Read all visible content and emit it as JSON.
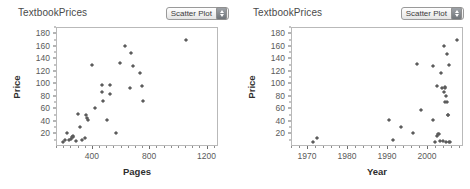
{
  "window": {
    "background": "#ffffff",
    "width": 470,
    "height": 189
  },
  "theme": {
    "point_color": "#5c5c5c",
    "axis_color": "#6b6b6b",
    "frame_color": "#b9b9b9",
    "title_color": "#4a4a4a",
    "label_color": "#5a5a5a"
  },
  "panels": [
    {
      "id": "pages-panel",
      "title": "TextbookPrices",
      "plot_type_menu": {
        "value": "Scatter Plot",
        "stepper_icon": "up-down-stepper-icon"
      }
    },
    {
      "id": "year-panel",
      "title": "TextbookPrices",
      "plot_type_menu": {
        "value": "Scatter Plot",
        "stepper_icon": "up-down-stepper-icon"
      }
    }
  ],
  "chart_data": [
    {
      "type": "scatter",
      "title": "TextbookPrices",
      "xlabel": "Pages",
      "ylabel": "Price",
      "xlim": [
        150,
        1280
      ],
      "ylim": [
        0,
        190
      ],
      "xticks": [
        400,
        800,
        1200
      ],
      "xtick_labels": [
        "400",
        "800",
        "1200"
      ],
      "xtick_minor_step": 50,
      "yticks": [
        20,
        40,
        60,
        80,
        100,
        120,
        140,
        160,
        180
      ],
      "ytick_labels": [
        "20",
        "40",
        "60",
        "80",
        "100",
        "120",
        "140",
        "160",
        "180"
      ],
      "grid": false,
      "legend": "none",
      "marker": "diamond",
      "points": [
        [
          200,
          6
        ],
        [
          210,
          9
        ],
        [
          224,
          20
        ],
        [
          240,
          10
        ],
        [
          252,
          11
        ],
        [
          262,
          14
        ],
        [
          268,
          16
        ],
        [
          272,
          15
        ],
        [
          290,
          8
        ],
        [
          300,
          51
        ],
        [
          318,
          31
        ],
        [
          330,
          9
        ],
        [
          352,
          13
        ],
        [
          360,
          49
        ],
        [
          366,
          45
        ],
        [
          374,
          41
        ],
        [
          402,
          130
        ],
        [
          424,
          60
        ],
        [
          470,
          86
        ],
        [
          474,
          97
        ],
        [
          478,
          72
        ],
        [
          508,
          41
        ],
        [
          524,
          97
        ],
        [
          528,
          83
        ],
        [
          566,
          20
        ],
        [
          598,
          132
        ],
        [
          634,
          160
        ],
        [
          668,
          93
        ],
        [
          676,
          148
        ],
        [
          690,
          128
        ],
        [
          736,
          116
        ],
        [
          760,
          72
        ],
        [
          752,
          96
        ],
        [
          1054,
          170
        ]
      ]
    },
    {
      "type": "scatter",
      "title": "TextbookPrices",
      "xlabel": "Year",
      "ylabel": "Price",
      "xlim": [
        1966,
        2009
      ],
      "ylim": [
        0,
        190
      ],
      "xticks": [
        1970,
        1980,
        1990,
        2000
      ],
      "xtick_labels": [
        "1970",
        "1980",
        "1990",
        "2000"
      ],
      "xtick_minor_step": 2,
      "yticks": [
        20,
        40,
        60,
        80,
        100,
        120,
        140,
        160,
        180
      ],
      "ytick_labels": [
        "20",
        "40",
        "60",
        "80",
        "100",
        "120",
        "140",
        "160",
        "180"
      ],
      "grid": false,
      "legend": "none",
      "marker": "diamond",
      "points": [
        [
          1971.6,
          6
        ],
        [
          1972.6,
          13
        ],
        [
          1990.6,
          41
        ],
        [
          1991.4,
          9
        ],
        [
          1993.6,
          31
        ],
        [
          1996.6,
          20
        ],
        [
          1997.6,
          131
        ],
        [
          1998.6,
          58
        ],
        [
          2001.4,
          127
        ],
        [
          2001.6,
          41
        ],
        [
          2001.9,
          6
        ],
        [
          2002.4,
          16
        ],
        [
          2002.6,
          96
        ],
        [
          2002.7,
          19
        ],
        [
          2002.9,
          19
        ],
        [
          2003.3,
          8
        ],
        [
          2003.6,
          116
        ],
        [
          2003.7,
          93
        ],
        [
          2003.9,
          8
        ],
        [
          2004.2,
          159
        ],
        [
          2004.3,
          86
        ],
        [
          2004.4,
          93
        ],
        [
          2004.5,
          95
        ],
        [
          2004.6,
          70
        ],
        [
          2004.7,
          80
        ],
        [
          2004.8,
          7
        ],
        [
          2005.0,
          147
        ],
        [
          2005.1,
          70
        ],
        [
          2005.2,
          50
        ],
        [
          2005.3,
          49
        ],
        [
          2005.4,
          129
        ],
        [
          2005.5,
          7
        ],
        [
          2005.8,
          7
        ],
        [
          2007.4,
          170
        ]
      ]
    }
  ]
}
